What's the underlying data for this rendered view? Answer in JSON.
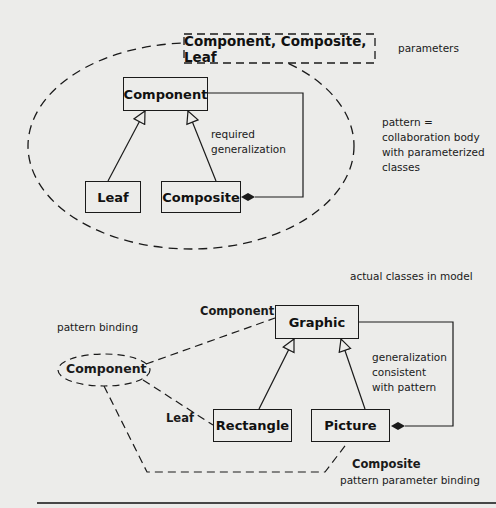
{
  "pattern": {
    "parameters_box": "Component, Composite, Leaf",
    "parameters_label": "parameters",
    "classes": {
      "component": "Component",
      "leaf": "Leaf",
      "composite": "Composite"
    },
    "required_generalization": [
      "required",
      "generalization"
    ],
    "pattern_note": [
      "pattern =",
      "collaboration body",
      "with parameterized",
      "classes"
    ]
  },
  "model": {
    "actual_classes_label": "actual classes in model",
    "classes": {
      "graphic": "Graphic",
      "rectangle": "Rectangle",
      "picture": "Picture"
    },
    "generalization_note": [
      "generalization",
      "consistent",
      "with pattern"
    ]
  },
  "binding": {
    "pattern_binding_label": "pattern binding",
    "usage": "Component",
    "role_component": "Component",
    "role_leaf": "Leaf",
    "role_composite": "Composite",
    "parameter_binding_label": "pattern parameter binding"
  }
}
